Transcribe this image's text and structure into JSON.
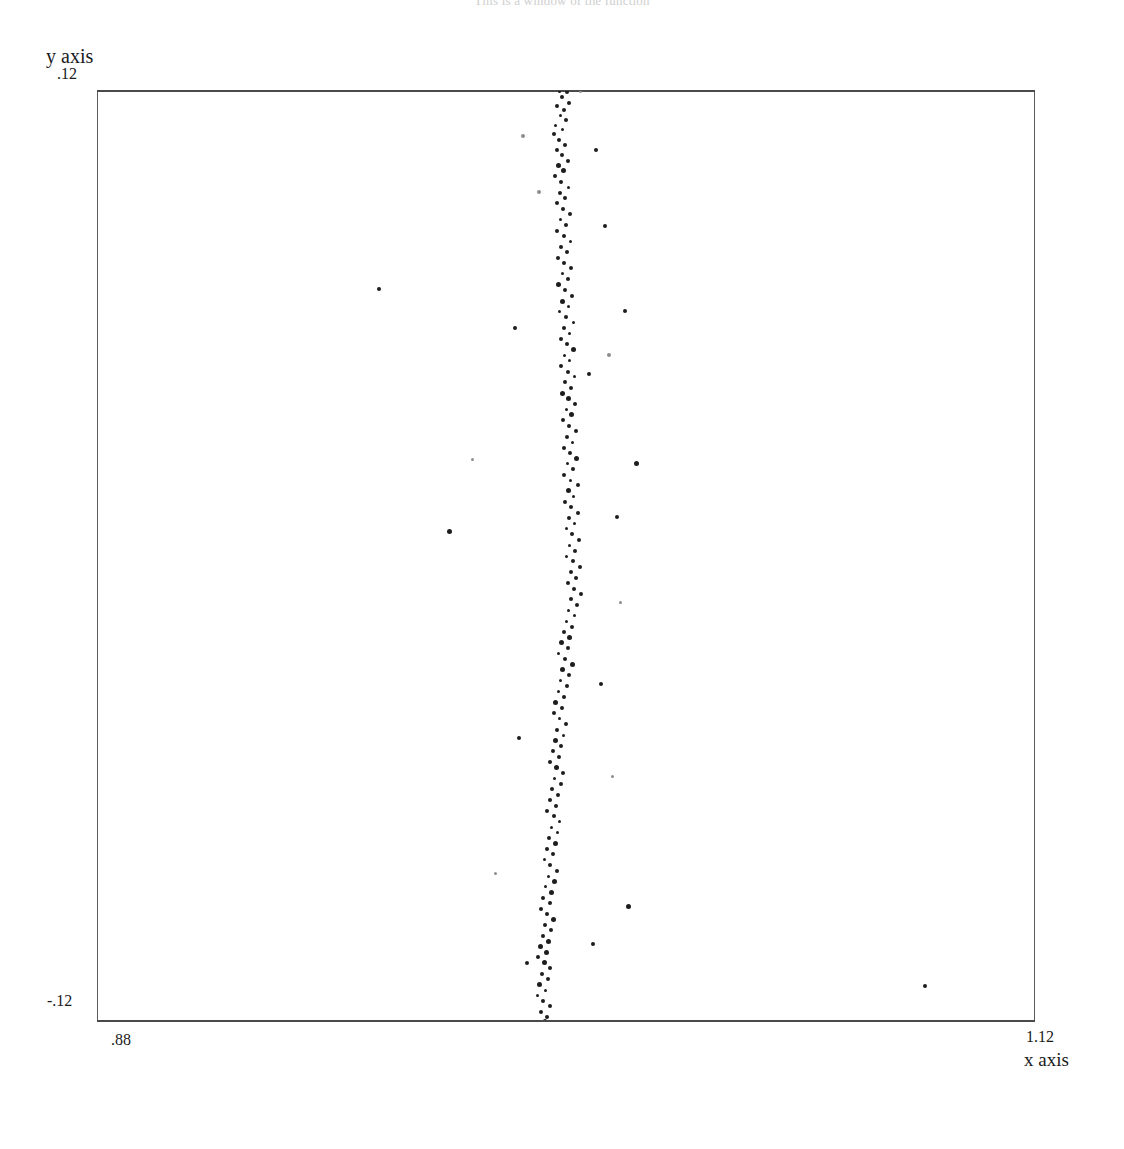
{
  "title": "This is a window of the function",
  "axes": {
    "y_caption": "y axis",
    "y_max_label": ".12",
    "y_min_label": "-.12",
    "x_caption": "x axis",
    "x_min_label": ".88",
    "x_max_label": "1.12"
  },
  "style": {
    "point_color": "#1d1d1d",
    "frame_color": "#5b5b5b",
    "background": "#ffffff"
  },
  "chart_data": {
    "type": "scatter",
    "title": "This is a window of the function",
    "xlabel": "x axis",
    "ylabel": "y axis",
    "xlim": [
      0.88,
      1.12
    ],
    "ylim": [
      -0.12,
      0.12
    ],
    "xticks": [
      0.88,
      1.12
    ],
    "yticks": [
      -0.12,
      0.12
    ],
    "grid": false,
    "legend": null,
    "marker": "dot",
    "series": [
      {
        "name": "main band",
        "points": [
          [
            0.9984,
            0.12
          ],
          [
            1.0002,
            0.1198
          ],
          [
            0.999,
            0.1185
          ],
          [
            1.0008,
            0.117
          ],
          [
            0.9978,
            0.1162
          ],
          [
            0.9996,
            0.115
          ],
          [
            0.9986,
            0.1138
          ],
          [
            1.0,
            0.1125
          ],
          [
            0.9974,
            0.1112
          ],
          [
            0.9992,
            0.11
          ],
          [
            0.9968,
            0.1088
          ],
          [
            0.9982,
            0.1074
          ],
          [
            0.9998,
            0.106
          ],
          [
            0.9976,
            0.1048
          ],
          [
            0.999,
            0.1034
          ],
          [
            1.0004,
            0.102
          ],
          [
            0.998,
            0.1008
          ],
          [
            0.9994,
            0.0994
          ],
          [
            0.9972,
            0.098
          ],
          [
            0.9988,
            0.0966
          ],
          [
            1.0006,
            0.0952
          ],
          [
            0.9984,
            0.0938
          ],
          [
            0.9998,
            0.0924
          ],
          [
            0.9976,
            0.091
          ],
          [
            0.9992,
            0.0896
          ],
          [
            1.001,
            0.0882
          ],
          [
            0.9986,
            0.0868
          ],
          [
            1.0,
            0.0854
          ],
          [
            0.9978,
            0.084
          ],
          [
            0.9994,
            0.0826
          ],
          [
            1.0012,
            0.0812
          ],
          [
            0.9988,
            0.0798
          ],
          [
            1.0002,
            0.0784
          ],
          [
            0.998,
            0.077
          ],
          [
            0.9996,
            0.0756
          ],
          [
            1.0014,
            0.0742
          ],
          [
            0.999,
            0.0728
          ],
          [
            1.0004,
            0.0714
          ],
          [
            0.9982,
            0.07
          ],
          [
            0.9998,
            0.0686
          ],
          [
            1.0016,
            0.0672
          ],
          [
            0.9992,
            0.0658
          ],
          [
            1.0006,
            0.0644
          ],
          [
            0.9984,
            0.063
          ],
          [
            1.0,
            0.0616
          ],
          [
            1.0018,
            0.0602
          ],
          [
            0.9994,
            0.0588
          ],
          [
            1.0008,
            0.0574
          ],
          [
            0.9986,
            0.056
          ],
          [
            1.0002,
            0.0546
          ],
          [
            1.002,
            0.0532
          ],
          [
            0.9996,
            0.0518
          ],
          [
            1.001,
            0.0504
          ],
          [
            0.9988,
            0.049
          ],
          [
            1.0004,
            0.0476
          ],
          [
            1.0022,
            0.0462
          ],
          [
            0.9998,
            0.0448
          ],
          [
            1.0012,
            0.0434
          ],
          [
            0.999,
            0.042
          ],
          [
            1.0006,
            0.0406
          ],
          [
            1.0024,
            0.0392
          ],
          [
            1.0,
            0.0378
          ],
          [
            1.0014,
            0.0364
          ],
          [
            0.9992,
            0.035
          ],
          [
            1.0008,
            0.0336
          ],
          [
            1.0026,
            0.0322
          ],
          [
            1.0002,
            0.0308
          ],
          [
            1.0016,
            0.0294
          ],
          [
            0.9994,
            0.028
          ],
          [
            1.001,
            0.0266
          ],
          [
            1.0028,
            0.0252
          ],
          [
            1.0004,
            0.0238
          ],
          [
            1.0018,
            0.0224
          ],
          [
            0.9996,
            0.021
          ],
          [
            1.0012,
            0.0196
          ],
          [
            1.003,
            0.0182
          ],
          [
            1.0006,
            0.0168
          ],
          [
            1.002,
            0.0154
          ],
          [
            0.9998,
            0.014
          ],
          [
            1.0014,
            0.0126
          ],
          [
            1.0032,
            0.0112
          ],
          [
            1.0008,
            0.0098
          ],
          [
            1.0022,
            0.0084
          ],
          [
            1.0,
            0.007
          ],
          [
            1.0016,
            0.0056
          ],
          [
            1.0034,
            0.0042
          ],
          [
            1.001,
            0.0028
          ],
          [
            1.0024,
            0.0014
          ],
          [
            1.0002,
            0.0
          ],
          [
            1.0018,
            -0.0014
          ],
          [
            1.0036,
            -0.0028
          ],
          [
            1.0012,
            -0.0042
          ],
          [
            1.0026,
            -0.0056
          ],
          [
            1.0004,
            -0.007
          ],
          [
            1.002,
            -0.0084
          ],
          [
            1.0038,
            -0.0098
          ],
          [
            1.0014,
            -0.0112
          ],
          [
            1.0028,
            -0.0126
          ],
          [
            1.0006,
            -0.014
          ],
          [
            1.0022,
            -0.0154
          ],
          [
            1.0,
            -0.0168
          ],
          [
            1.0016,
            -0.0182
          ],
          [
            0.9994,
            -0.0196
          ],
          [
            1.001,
            -0.021
          ],
          [
            0.9988,
            -0.0224
          ],
          [
            1.0004,
            -0.0238
          ],
          [
            0.9982,
            -0.0252
          ],
          [
            0.9998,
            -0.0266
          ],
          [
            1.0016,
            -0.028
          ],
          [
            0.9992,
            -0.0294
          ],
          [
            1.0008,
            -0.0308
          ],
          [
            0.9986,
            -0.0322
          ],
          [
            1.0002,
            -0.0336
          ],
          [
            0.998,
            -0.035
          ],
          [
            0.9996,
            -0.0364
          ],
          [
            0.9974,
            -0.0378
          ],
          [
            0.999,
            -0.0392
          ],
          [
            0.9968,
            -0.0406
          ],
          [
            0.9984,
            -0.042
          ],
          [
            1.0,
            -0.0434
          ],
          [
            0.9978,
            -0.0448
          ],
          [
            0.9994,
            -0.0462
          ],
          [
            0.9972,
            -0.0476
          ],
          [
            0.9988,
            -0.049
          ],
          [
            0.9966,
            -0.0504
          ],
          [
            0.9982,
            -0.0518
          ],
          [
            0.996,
            -0.0532
          ],
          [
            0.9976,
            -0.0546
          ],
          [
            0.9992,
            -0.056
          ],
          [
            0.997,
            -0.0574
          ],
          [
            0.9986,
            -0.0588
          ],
          [
            0.9964,
            -0.0602
          ],
          [
            0.998,
            -0.0616
          ],
          [
            0.9958,
            -0.063
          ],
          [
            0.9974,
            -0.0644
          ],
          [
            0.9952,
            -0.0658
          ],
          [
            0.9968,
            -0.0672
          ],
          [
            0.9984,
            -0.0686
          ],
          [
            0.9962,
            -0.07
          ],
          [
            0.9978,
            -0.0714
          ],
          [
            0.9956,
            -0.0728
          ],
          [
            0.9972,
            -0.0742
          ],
          [
            0.995,
            -0.0756
          ],
          [
            0.9966,
            -0.077
          ],
          [
            0.9944,
            -0.0784
          ],
          [
            0.996,
            -0.0798
          ],
          [
            0.9976,
            -0.0812
          ],
          [
            0.9954,
            -0.0826
          ],
          [
            0.997,
            -0.084
          ],
          [
            0.9948,
            -0.0854
          ],
          [
            0.9964,
            -0.0868
          ],
          [
            0.9942,
            -0.0882
          ],
          [
            0.9958,
            -0.0896
          ],
          [
            0.9936,
            -0.091
          ],
          [
            0.9952,
            -0.0924
          ],
          [
            0.9968,
            -0.0938
          ],
          [
            0.9946,
            -0.0952
          ],
          [
            0.9962,
            -0.0966
          ],
          [
            0.994,
            -0.098
          ],
          [
            0.9956,
            -0.0994
          ],
          [
            0.9934,
            -0.1008
          ],
          [
            0.995,
            -0.1022
          ],
          [
            0.9928,
            -0.1036
          ],
          [
            0.9944,
            -0.105
          ],
          [
            0.996,
            -0.1064
          ],
          [
            0.9938,
            -0.1078
          ],
          [
            0.9954,
            -0.1092
          ],
          [
            0.9932,
            -0.1106
          ],
          [
            0.9948,
            -0.112
          ],
          [
            0.9926,
            -0.1134
          ],
          [
            0.9942,
            -0.1148
          ],
          [
            0.9958,
            -0.1162
          ],
          [
            0.9936,
            -0.1176
          ],
          [
            0.9952,
            -0.119
          ],
          [
            0.9946,
            -0.12
          ]
        ]
      },
      {
        "name": "outliers",
        "points": [
          [
            1.0038,
            0.1198
          ],
          [
            0.989,
            0.1085
          ],
          [
            1.0076,
            0.1048
          ],
          [
            0.993,
            0.094
          ],
          [
            1.01,
            0.0852
          ],
          [
            0.952,
            0.069
          ],
          [
            1.015,
            0.0632
          ],
          [
            0.987,
            0.0588
          ],
          [
            1.011,
            0.052
          ],
          [
            1.006,
            0.047
          ],
          [
            0.976,
            0.0248
          ],
          [
            1.018,
            0.0238
          ],
          [
            1.013,
            0.01
          ],
          [
            0.97,
            0.0062
          ],
          [
            1.014,
            -0.012
          ],
          [
            1.009,
            -0.033
          ],
          [
            0.988,
            -0.047
          ],
          [
            1.012,
            -0.057
          ],
          [
            0.982,
            -0.082
          ],
          [
            1.016,
            -0.0905
          ],
          [
            1.007,
            -0.1
          ],
          [
            0.99,
            -0.105
          ],
          [
            1.092,
            -0.111
          ]
        ]
      }
    ]
  }
}
